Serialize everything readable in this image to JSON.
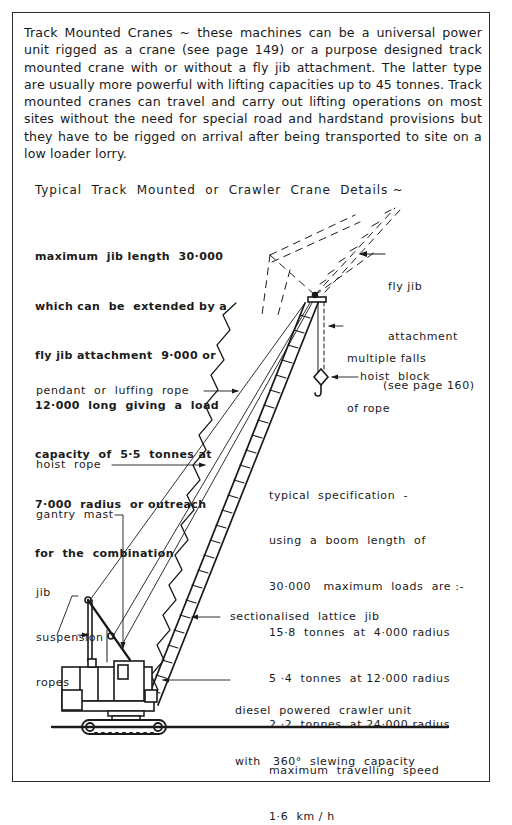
{
  "intro": {
    "text": "Track Mounted Cranes ~ these machines can be a universal power unit rigged as a crane (see page 149) or a purpose designed track mounted crane with or without a fly jib attachment. The latter type are usually more powerful with lifting capacities up to 45 tonnes. Track mounted cranes can travel and carry out lifting operations on most sites without the need for special road and hardstand provisions but they have to be rigged on arrival after being transported to site on a low loader lorry."
  },
  "diagram": {
    "heading": "Typical  Track  Mounted  or  Crawler  Crane  Details ~",
    "jib_note": [
      "maximum  jib length  30·000",
      "which can  be  extended by a",
      "fly jib attachment  9·000 or",
      "12·000  long  giving  a  load",
      "capacity  of  5·5  tonnes at",
      "7·000  radius  or outreach",
      "for  the  combination"
    ],
    "labels": {
      "fly_jib": [
        "fly jib",
        "attachment",
        "(see page 160)"
      ],
      "multiple_falls": [
        "multiple falls",
        "of rope"
      ],
      "hoist_block": "hoist  block",
      "pendant_rope": "pendant  or  luffing  rope",
      "hoist_rope": "hoist  rope",
      "gantry_mast": "gantry  mast",
      "jib_suspension": [
        "jib",
        "suspension",
        "ropes"
      ],
      "lattice_jib": "sectionalised  lattice  jib",
      "crawler_unit": [
        "diesel  powered  crawler unit",
        "with   360°  slewing  capacity"
      ]
    },
    "specification": [
      "typical  specification  -",
      "using  a  boom  length  of",
      "30·000   maximum  loads  are :-",
      "15·8  tonnes  at  4·000 radius",
      "5 ·4  tonnes  at 12·000 radius",
      "2 ·2  tonnes  at 24·000 radius",
      "maximum  travelling  speed",
      "1·6  km / h"
    ]
  },
  "colors": {
    "ink": "#1a1a1a",
    "frame": "#2a2a2a",
    "background": "#ffffff"
  }
}
